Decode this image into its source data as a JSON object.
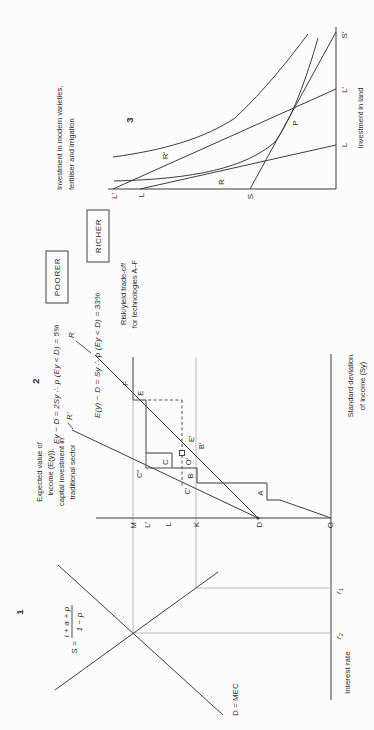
{
  "figure": {
    "panel1": {
      "number": "1",
      "supply_eq": {
        "lhs": "S =",
        "num": "i + a + p",
        "den": "1 − p"
      },
      "demand_label": "D = MEC",
      "axis_label": "Interest rate",
      "ticks": {
        "r1_base": "r",
        "r1_sub": "1",
        "r2_base": "r",
        "r2_sub": "2"
      }
    },
    "panel2": {
      "number": "2",
      "y_axis_title": [
        "Expected value of",
        "income (E(y)),",
        "capital investment in",
        "traditional sector"
      ],
      "x_axis_title": [
        "Standard deviation",
        "of income (Sy)"
      ],
      "poorer_eq": "Ey − D = 2Sy ∴ p (Ey < D) = 5%",
      "poorer_tag": "POORER",
      "richer_eq": "E(y) − D = Sy ∴ p (Ey < D) = 33%",
      "richer_tag": "RICHER",
      "tradeoff_note": [
        "Risk/yield trade-off",
        "for technologies A–F"
      ],
      "ray_r_prime": "R′",
      "ray_r": "R",
      "y_axis_points": {
        "M": "M",
        "L_prime": "L′",
        "L": "L",
        "K": "K",
        "D": "D",
        "O": "O"
      },
      "tech": {
        "A": "A",
        "B": "B",
        "C": "C",
        "E": "E",
        "F": "F"
      },
      "marks": {
        "B_prime": "B′",
        "C_prime": "C′",
        "C_dprime": "C″",
        "E_prime": "E′",
        "O_prime": "O′"
      }
    },
    "panel3": {
      "number": "3",
      "title": [
        "Investment in modern varieties,",
        "fertiliser and irrigation"
      ],
      "x_axis_label": "Investment in land",
      "x_ticks": {
        "L": "L",
        "L_prime": "L′",
        "S_prime": "S′"
      },
      "y_ticks": {
        "L_prime": "L′",
        "L": "L"
      },
      "labels": {
        "R": "R",
        "R_prime": "R′",
        "S": "S",
        "P": "P"
      }
    }
  }
}
